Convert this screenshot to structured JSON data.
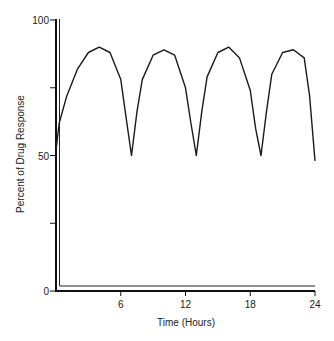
{
  "chart_data": {
    "type": "line",
    "title": "",
    "xlabel": "Time (Hours)",
    "ylabel": "Percent of Drug Response",
    "xlim": [
      0,
      24
    ],
    "ylim": [
      0,
      100
    ],
    "x_ticks": [
      6,
      12,
      18,
      24
    ],
    "x_tick_labels": [
      "6",
      "12",
      "18",
      "24"
    ],
    "y_ticks": [
      0,
      25,
      50,
      75,
      100
    ],
    "y_tick_labels": [
      "0",
      "",
      "50",
      "",
      "100"
    ],
    "grid": false,
    "legend": null,
    "series": [
      {
        "name": "Drug response",
        "x": [
          0,
          0.3,
          1,
          2,
          3,
          4,
          5,
          6,
          6.5,
          7,
          7.5,
          8,
          9,
          10,
          11,
          12,
          12.5,
          13,
          13.5,
          14,
          15,
          16,
          17,
          18,
          18.5,
          19,
          19.5,
          20,
          21,
          22,
          23,
          23.5,
          24
        ],
        "y": [
          52,
          62,
          72,
          82,
          88,
          90,
          88,
          78,
          64,
          50,
          66,
          78,
          87,
          89,
          87,
          75,
          62,
          50,
          66,
          79,
          88,
          90,
          86,
          74,
          60,
          50,
          66,
          80,
          88,
          89,
          86,
          72,
          48
        ]
      }
    ]
  }
}
